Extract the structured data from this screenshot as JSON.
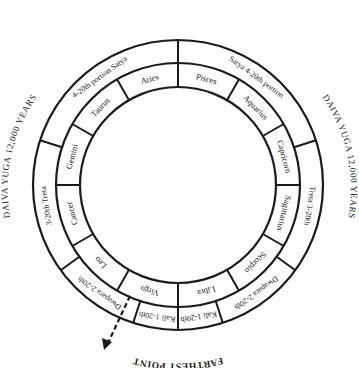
{
  "diagram": {
    "top_label": "NEAREST POINT",
    "bottom_label": "FARTHEST POINT",
    "left_label": "DAIVA YUGA  12,000 YEARS",
    "right_label": "DAIVA YUGA  12,000 YEARS",
    "center": [
      178,
      185
    ],
    "radii": {
      "outer": 145,
      "middle": 122,
      "inner": 98
    },
    "zodiac_signs": [
      "Pisces",
      "Aquarius",
      "Capricorn",
      "Sagittarius",
      "Scorpio",
      "Libra",
      "Virgo",
      "Leo",
      "Cancer",
      "Gemini",
      "Taurus",
      "Aries"
    ],
    "yuga_segments": [
      {
        "label": "Satya  4-20th portion",
        "start_deg": 0,
        "end_deg": 72
      },
      {
        "label": "Treta  3-20th",
        "start_deg": 72,
        "end_deg": 126
      },
      {
        "label": "Dwapara 2-20th",
        "start_deg": 126,
        "end_deg": 162
      },
      {
        "label": "Kali 1-20th",
        "start_deg": 162,
        "end_deg": 180
      },
      {
        "label": "Kali 1-20th",
        "start_deg": 180,
        "end_deg": 198
      },
      {
        "label": "Dwapara 2-20th",
        "start_deg": 198,
        "end_deg": 234
      },
      {
        "label": "3-20th Treta",
        "start_deg": 234,
        "end_deg": 288
      },
      {
        "label": "4-20th portion Satya",
        "start_deg": 288,
        "end_deg": 360
      }
    ],
    "arrow": {
      "from": [
        130,
        296
      ],
      "to": [
        106,
        348
      ],
      "style": "dashed"
    }
  }
}
